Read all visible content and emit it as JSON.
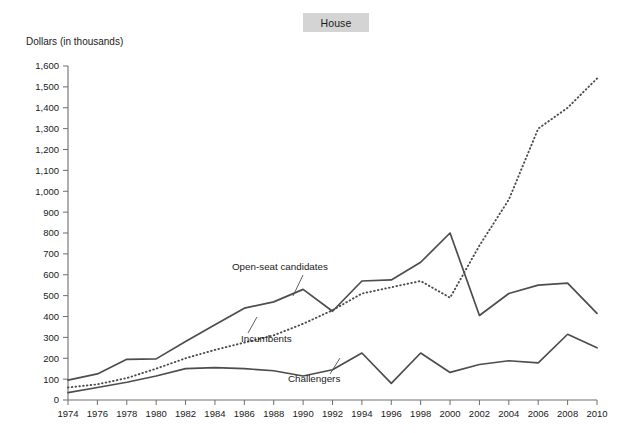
{
  "title": "House",
  "axis_note": "Dollars (in thousands)",
  "chart_data": {
    "type": "line",
    "title": "House",
    "xlabel": "",
    "ylabel": "Dollars (in thousands)",
    "xlim": [
      1974,
      2010
    ],
    "ylim": [
      0,
      1600
    ],
    "ytick_step": 100,
    "grid": false,
    "legend": "inline-annotations",
    "categories": [
      1974,
      1976,
      1978,
      1980,
      1982,
      1984,
      1986,
      1988,
      1990,
      1992,
      1994,
      1996,
      1998,
      2000,
      2002,
      2004,
      2006,
      2008,
      2010
    ],
    "xticklabels": [
      "1974",
      "1976",
      "1978",
      "1980",
      "1982",
      "1984",
      "1986",
      "1988",
      "1990",
      "1992",
      "1994",
      "1996",
      "1998",
      "2000",
      "2002",
      "2004",
      "2006",
      "2008",
      "2010"
    ],
    "yticklabels": [
      "0",
      "100",
      "200",
      "300",
      "400",
      "500",
      "600",
      "700",
      "800",
      "900",
      "1,000",
      "1,100",
      "1,200",
      "1,300",
      "1,400",
      "1,500",
      "1,600"
    ],
    "series": [
      {
        "name": "Open-seat candidates",
        "style": "solid",
        "values": [
          95,
          125,
          195,
          197,
          280,
          360,
          440,
          470,
          530,
          425,
          570,
          575,
          660,
          800,
          405,
          510,
          550,
          560,
          415
        ]
      },
      {
        "name": "Incumbents",
        "style": "dotted",
        "values": [
          60,
          75,
          105,
          150,
          200,
          240,
          275,
          310,
          365,
          430,
          510,
          540,
          570,
          490,
          740,
          960,
          1300,
          1400,
          1540
        ]
      },
      {
        "name": "Challengers",
        "style": "solid",
        "values": [
          35,
          60,
          85,
          115,
          150,
          155,
          150,
          140,
          115,
          145,
          225,
          80,
          225,
          132,
          170,
          188,
          178,
          315,
          250
        ]
      }
    ],
    "annotations": [
      {
        "text": "Open-seat candidates",
        "series": "Open-seat candidates"
      },
      {
        "text": "Incumbents",
        "series": "Incumbents"
      },
      {
        "text": "Challengers",
        "series": "Challengers"
      }
    ]
  }
}
